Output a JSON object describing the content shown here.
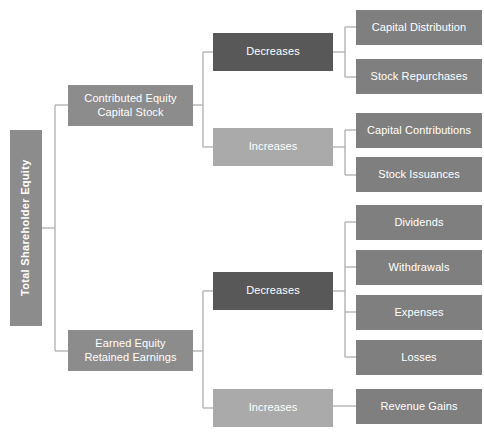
{
  "diagram": {
    "type": "tree-diagram",
    "orientation": "left-to-right",
    "background_color": "#ffffff",
    "connector_color": "#b3b3b3",
    "text_color": "#ffffff",
    "colors": {
      "root": "#8c8c8c",
      "category": "#8c8c8c",
      "decreases": "#585858",
      "increases": "#aaaaaa",
      "leaf": "#7f7f7f"
    },
    "root": {
      "id": "total-shareholder-equity",
      "label": "Total Shareholder Equity",
      "orientation": "vertical",
      "color": "#8c8c8c",
      "x": 10,
      "y": 130,
      "w": 32,
      "h": 196,
      "font_size": 11
    },
    "categories": [
      {
        "id": "contributed-equity",
        "label": "Contributed Equity\nCapital Stock",
        "color": "#8c8c8c",
        "x": 68,
        "y": 85,
        "w": 125,
        "h": 41,
        "font_size": 11
      },
      {
        "id": "earned-equity",
        "label": "Earned Equity\nRetained Earnings",
        "color": "#8c8c8c",
        "x": 68,
        "y": 330,
        "w": 125,
        "h": 41,
        "font_size": 11
      }
    ],
    "changes": [
      {
        "id": "contributed-decreases",
        "label": "Decreases",
        "color": "#585858",
        "x": 213,
        "y": 33,
        "w": 120,
        "h": 38,
        "font_size": 11
      },
      {
        "id": "contributed-increases",
        "label": "Increases",
        "color": "#aaaaaa",
        "x": 213,
        "y": 128,
        "w": 120,
        "h": 38,
        "font_size": 11
      },
      {
        "id": "earned-decreases",
        "label": "Decreases",
        "color": "#585858",
        "x": 213,
        "y": 272,
        "w": 120,
        "h": 38,
        "font_size": 11
      },
      {
        "id": "earned-increases",
        "label": "Increases",
        "color": "#aaaaaa",
        "x": 213,
        "y": 389,
        "w": 120,
        "h": 38,
        "font_size": 11
      }
    ],
    "leaves": [
      {
        "id": "capital-distribution",
        "label": "Capital Distribution",
        "parent": "contributed-decreases",
        "color": "#7f7f7f",
        "x": 356,
        "y": 10,
        "w": 126,
        "h": 35,
        "font_size": 11
      },
      {
        "id": "stock-repurchases",
        "label": "Stock Repurchases",
        "parent": "contributed-decreases",
        "color": "#7f7f7f",
        "x": 356,
        "y": 59,
        "w": 126,
        "h": 35,
        "font_size": 11
      },
      {
        "id": "capital-contributions",
        "label": "Capital Contributions",
        "parent": "contributed-increases",
        "color": "#7f7f7f",
        "x": 356,
        "y": 113,
        "w": 126,
        "h": 35,
        "font_size": 11
      },
      {
        "id": "stock-issuances",
        "label": "Stock Issuances",
        "parent": "contributed-increases",
        "color": "#7f7f7f",
        "x": 356,
        "y": 157,
        "w": 126,
        "h": 35,
        "font_size": 11
      },
      {
        "id": "dividends",
        "label": "Dividends",
        "parent": "earned-decreases",
        "color": "#7f7f7f",
        "x": 356,
        "y": 205,
        "w": 126,
        "h": 35,
        "font_size": 11
      },
      {
        "id": "withdrawals",
        "label": "Withdrawals",
        "parent": "earned-decreases",
        "color": "#7f7f7f",
        "x": 356,
        "y": 250,
        "w": 126,
        "h": 35,
        "font_size": 11
      },
      {
        "id": "expenses",
        "label": "Expenses",
        "parent": "earned-decreases",
        "color": "#7f7f7f",
        "x": 356,
        "y": 295,
        "w": 126,
        "h": 35,
        "font_size": 11
      },
      {
        "id": "losses",
        "label": "Losses",
        "parent": "earned-decreases",
        "color": "#7f7f7f",
        "x": 356,
        "y": 340,
        "w": 126,
        "h": 35,
        "font_size": 11
      },
      {
        "id": "revenue-gains",
        "label": "Revenue Gains",
        "parent": "earned-increases",
        "color": "#7f7f7f",
        "x": 356,
        "y": 389,
        "w": 126,
        "h": 35,
        "font_size": 11
      }
    ],
    "connectors": [
      {
        "id": "root-trunk",
        "d": "M 42 228 L 55 228"
      },
      {
        "id": "root-spine",
        "d": "M 55 105 L 55 351"
      },
      {
        "id": "root-to-contributed",
        "d": "M 55 105 L 68 105"
      },
      {
        "id": "root-to-earned",
        "d": "M 55 351 L 68 351"
      },
      {
        "id": "contributed-trunk",
        "d": "M 193 105 L 203 105"
      },
      {
        "id": "contributed-spine",
        "d": "M 203 52 L 203 147"
      },
      {
        "id": "contributed-to-decreases",
        "d": "M 203 52 L 213 52"
      },
      {
        "id": "contributed-to-increases",
        "d": "M 203 147 L 213 147"
      },
      {
        "id": "earned-trunk",
        "d": "M 193 351 L 203 351"
      },
      {
        "id": "earned-spine",
        "d": "M 203 291 L 203 408"
      },
      {
        "id": "earned-to-decreases",
        "d": "M 203 291 L 213 291"
      },
      {
        "id": "earned-to-increases",
        "d": "M 203 408 L 213 408"
      },
      {
        "id": "cdec-trunk",
        "d": "M 333 52 L 345 52"
      },
      {
        "id": "cdec-spine",
        "d": "M 345 27 L 345 77"
      },
      {
        "id": "cdec-to-capital-distribution",
        "d": "M 345 27 L 356 27"
      },
      {
        "id": "cdec-to-stock-repurchases",
        "d": "M 345 77 L 356 77"
      },
      {
        "id": "cinc-trunk",
        "d": "M 333 147 L 345 147"
      },
      {
        "id": "cinc-spine",
        "d": "M 345 130 L 345 175"
      },
      {
        "id": "cinc-to-capital-contributions",
        "d": "M 345 130 L 356 130"
      },
      {
        "id": "cinc-to-stock-issuances",
        "d": "M 345 175 L 356 175"
      },
      {
        "id": "edec-trunk",
        "d": "M 333 291 L 345 291"
      },
      {
        "id": "edec-spine",
        "d": "M 345 222 L 345 357"
      },
      {
        "id": "edec-to-dividends",
        "d": "M 345 222 L 356 222"
      },
      {
        "id": "edec-to-withdrawals",
        "d": "M 345 267 L 356 267"
      },
      {
        "id": "edec-to-expenses",
        "d": "M 345 312 L 356 312"
      },
      {
        "id": "edec-to-losses",
        "d": "M 345 357 L 356 357"
      },
      {
        "id": "einc-to-revenue-gains",
        "d": "M 333 406 L 356 406"
      }
    ]
  }
}
